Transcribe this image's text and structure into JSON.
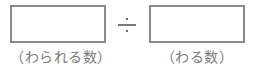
{
  "expression": {
    "operator_symbol": "÷",
    "operator_icon": "divide-icon",
    "dividend": {
      "value": "",
      "label": "（わられる数）"
    },
    "divisor": {
      "value": "",
      "label": "（わる数）"
    }
  },
  "colors": {
    "border": "#8a8a8a",
    "text": "#7a7a7a",
    "background": "#ffffff"
  }
}
